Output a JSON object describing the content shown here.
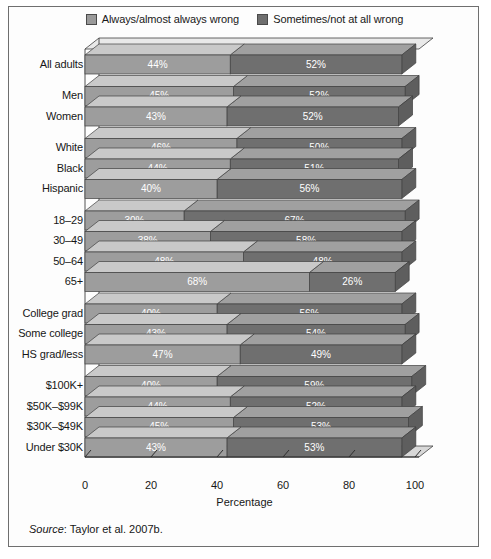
{
  "legend": {
    "entries": [
      {
        "label": "Always/almost always wrong",
        "swatch": "light",
        "color": "#9a9a9a"
      },
      {
        "label": "Sometimes/not at all wrong",
        "swatch": "dark",
        "color": "#6e6e6e"
      }
    ]
  },
  "axis": {
    "title": "Percentage",
    "ticks": [
      "0",
      "20",
      "40",
      "60",
      "80",
      "100"
    ]
  },
  "source": {
    "word": "Source",
    "text": ": Taylor et al. 2007b."
  },
  "chart_data": {
    "type": "bar",
    "orientation": "horizontal",
    "stacked": true,
    "title": "",
    "xlabel": "Percentage",
    "ylabel": "",
    "xlim": [
      0,
      100
    ],
    "xticks": [
      0,
      20,
      40,
      60,
      80,
      100
    ],
    "grid": false,
    "legend_position": "top-center",
    "series": [
      {
        "name": "Always/almost always wrong",
        "color": "#9a9a9a",
        "values": [
          44,
          45,
          43,
          46,
          44,
          40,
          30,
          38,
          48,
          68,
          40,
          43,
          47,
          40,
          44,
          45,
          43
        ]
      },
      {
        "name": "Sometimes/not at all wrong",
        "color": "#6e6e6e",
        "values": [
          52,
          52,
          52,
          50,
          51,
          56,
          67,
          58,
          48,
          26,
          56,
          54,
          49,
          59,
          52,
          53,
          53
        ]
      }
    ],
    "categories": [
      "All adults",
      "Men",
      "Women",
      "White",
      "Black",
      "Hispanic",
      "18–29",
      "30–49",
      "50–64",
      "65+",
      "College grad",
      "Some college",
      "HS grad/less",
      "$100K+",
      "$50K–$99K",
      "$30K–$49K",
      "Under $30K"
    ],
    "groups": [
      {
        "name": "all",
        "categories": [
          "All adults"
        ]
      },
      {
        "name": "gender",
        "categories": [
          "Men",
          "Women"
        ]
      },
      {
        "name": "race",
        "categories": [
          "White",
          "Black",
          "Hispanic"
        ]
      },
      {
        "name": "age",
        "categories": [
          "18–29",
          "30–49",
          "50–64",
          "65+"
        ]
      },
      {
        "name": "education",
        "categories": [
          "College grad",
          "Some college",
          "HS grad/less"
        ]
      },
      {
        "name": "income",
        "categories": [
          "$100K+",
          "$50K–$99K",
          "$30K–$49K",
          "Under $30K"
        ]
      }
    ],
    "bars": [
      {
        "label": "All adults",
        "group": 0,
        "light": 44,
        "dark": 52,
        "light_text": "44%",
        "dark_text": "52%"
      },
      {
        "label": "Men",
        "group": 1,
        "light": 45,
        "dark": 52,
        "light_text": "45%",
        "dark_text": "52%"
      },
      {
        "label": "Women",
        "group": 1,
        "light": 43,
        "dark": 52,
        "light_text": "43%",
        "dark_text": "52%"
      },
      {
        "label": "White",
        "group": 2,
        "light": 46,
        "dark": 50,
        "light_text": "46%",
        "dark_text": "50%"
      },
      {
        "label": "Black",
        "group": 2,
        "light": 44,
        "dark": 51,
        "light_text": "44%",
        "dark_text": "51%"
      },
      {
        "label": "Hispanic",
        "group": 2,
        "light": 40,
        "dark": 56,
        "light_text": "40%",
        "dark_text": "56%"
      },
      {
        "label": "18–29",
        "group": 3,
        "light": 30,
        "dark": 67,
        "light_text": "30%",
        "dark_text": "67%"
      },
      {
        "label": "30–49",
        "group": 3,
        "light": 38,
        "dark": 58,
        "light_text": "38%",
        "dark_text": "58%"
      },
      {
        "label": "50–64",
        "group": 3,
        "light": 48,
        "dark": 48,
        "light_text": "48%",
        "dark_text": "48%"
      },
      {
        "label": "65+",
        "group": 3,
        "light": 68,
        "dark": 26,
        "light_text": "68%",
        "dark_text": "26%"
      },
      {
        "label": "College grad",
        "group": 4,
        "light": 40,
        "dark": 56,
        "light_text": "40%",
        "dark_text": "56%"
      },
      {
        "label": "Some college",
        "group": 4,
        "light": 43,
        "dark": 54,
        "light_text": "43%",
        "dark_text": "54%"
      },
      {
        "label": "HS grad/less",
        "group": 4,
        "light": 47,
        "dark": 49,
        "light_text": "47%",
        "dark_text": "49%"
      },
      {
        "label": "$100K+",
        "group": 5,
        "light": 40,
        "dark": 59,
        "light_text": "40%",
        "dark_text": "59%"
      },
      {
        "label": "$50K–$99K",
        "group": 5,
        "light": 44,
        "dark": 52,
        "light_text": "44%",
        "dark_text": "52%"
      },
      {
        "label": "$30K–$49K",
        "group": 5,
        "light": 45,
        "dark": 53,
        "light_text": "45%",
        "dark_text": "53%"
      },
      {
        "label": "Under $30K",
        "group": 5,
        "light": 43,
        "dark": 53,
        "light_text": "43%",
        "dark_text": "53%"
      }
    ]
  }
}
